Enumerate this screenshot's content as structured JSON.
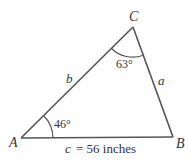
{
  "diagram": {
    "type": "triangle",
    "vertices": {
      "A": {
        "label": "A",
        "x": 21,
        "y": 138
      },
      "B": {
        "label": "B",
        "x": 173,
        "y": 137
      },
      "C": {
        "label": "C",
        "x": 133,
        "y": 27
      }
    },
    "sides": {
      "a": {
        "label": "a"
      },
      "b": {
        "label": "b"
      },
      "c": {
        "label": "c",
        "value_text": "= 56 inches"
      }
    },
    "angles": {
      "A": {
        "label": "46°"
      },
      "C": {
        "label": "63°"
      }
    },
    "colors": {
      "stroke": "#555555",
      "text": "#333333"
    }
  }
}
